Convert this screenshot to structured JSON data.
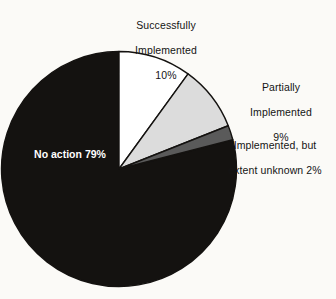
{
  "chart_data": {
    "type": "pie",
    "title": "",
    "subtitle": "",
    "xlabel": "",
    "ylabel": "",
    "legend_position": "none",
    "grid": false,
    "start_angle_deg": 0,
    "direction": "clockwise",
    "categories": [
      "Successfully Implemented",
      "Partially Implemented",
      "Implemented, but extent unknown",
      "No action"
    ],
    "values": [
      10,
      9,
      2,
      79
    ],
    "value_labels": [
      "10%",
      "9%",
      "2%",
      "79%"
    ],
    "units": "percent",
    "colors": [
      "#ffffff",
      "#dcdcdc",
      "#5a5a5a",
      "#141210"
    ],
    "slices": [
      {
        "name": "Successfully Implemented",
        "value": 10,
        "value_label": "10%",
        "color": "#ffffff",
        "start_deg": 0,
        "end_deg": 36,
        "label_placement": "outside-top"
      },
      {
        "name": "Partially Implemented",
        "value": 9,
        "value_label": "9%",
        "color": "#dcdcdc",
        "start_deg": 36,
        "end_deg": 68.4,
        "label_placement": "outside-right"
      },
      {
        "name": "Implemented, but extent unknown",
        "value": 2,
        "value_label": "2%",
        "color": "#5a5a5a",
        "start_deg": 68.4,
        "end_deg": 75.6,
        "label_placement": "outside-right"
      },
      {
        "name": "No action",
        "value": 79,
        "value_label": "79%",
        "color": "#141210",
        "start_deg": 75.6,
        "end_deg": 360,
        "label_placement": "inside-left"
      }
    ]
  },
  "labels": {
    "successfully": {
      "line1": "Successfully",
      "line2": "Implemented",
      "line3": "10%"
    },
    "partially": {
      "line1": "Partially",
      "line2": "Implemented",
      "line3": "9%"
    },
    "extent_unknown": {
      "line1": "Implemented, but",
      "line2": "extent unknown 2%"
    },
    "no_action": {
      "line1": "No action",
      "line2": "79%"
    }
  },
  "style": {
    "background": "#fbfaf7",
    "outline": "#141210",
    "text": "#141414",
    "inside_text": "#ffffff"
  }
}
